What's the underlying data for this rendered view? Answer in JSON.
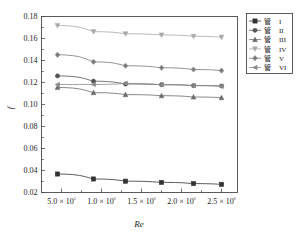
{
  "chart_data": {
    "type": "line",
    "title": "",
    "xlabel": "Re",
    "ylabel": "f",
    "xlim": [
      250000,
      2700000
    ],
    "ylim": [
      0.02,
      0.18
    ],
    "grid": false,
    "legend_position": "right-outside",
    "x": [
      450000,
      900000,
      1300000,
      1750000,
      2150000,
      2500000
    ],
    "xtick_values": [
      500000,
      1000000,
      1500000,
      2000000,
      2500000
    ],
    "xtick_labels": [
      "5.0 × 10⁵",
      "1.0 × 10⁶",
      "1.5 × 10⁶",
      "2.0 × 10⁶",
      "2.5 × 10⁶"
    ],
    "ytick_values": [
      0.02,
      0.04,
      0.06,
      0.08,
      0.1,
      0.12,
      0.14,
      0.16,
      0.18
    ],
    "ytick_labels": [
      "0.02",
      "0.04",
      "0.06",
      "0.08",
      "0.10",
      "0.12",
      "0.14",
      "0.16",
      "0.18"
    ],
    "series": [
      {
        "name": "管 I",
        "label_cn": "管",
        "label_roman": "I",
        "marker": "square-filled",
        "color": "#333333",
        "values": [
          0.0368,
          0.0323,
          0.0303,
          0.0292,
          0.0281,
          0.0274
        ]
      },
      {
        "name": "管 II",
        "label_cn": "管",
        "label_roman": "II",
        "marker": "circle-filled",
        "color": "#555555",
        "values": [
          0.126,
          0.1212,
          0.1186,
          0.118,
          0.1172,
          0.1168
        ]
      },
      {
        "name": "管 III",
        "label_cn": "管",
        "label_roman": "III",
        "marker": "triangle-up",
        "color": "#6a6a6a",
        "values": [
          0.1155,
          0.1108,
          0.109,
          0.108,
          0.1068,
          0.1062
        ]
      },
      {
        "name": "管 IV",
        "label_cn": "管",
        "label_roman": "IV",
        "marker": "triangle-down",
        "color": "#a8a8a8",
        "values": [
          0.1718,
          0.1662,
          0.1643,
          0.1632,
          0.162,
          0.1612
        ]
      },
      {
        "name": "管 V",
        "label_cn": "管",
        "label_roman": "V",
        "marker": "diamond",
        "color": "#7a7a7a",
        "values": [
          0.1452,
          0.1388,
          0.1352,
          0.1334,
          0.1318,
          0.1308
        ]
      },
      {
        "name": "管 VI",
        "label_cn": "管",
        "label_roman": "VI",
        "marker": "left-triangle",
        "color": "#8a8a8a",
        "values": [
          0.1182,
          0.1182,
          0.1192,
          0.118,
          0.1172,
          0.1166
        ]
      }
    ]
  }
}
